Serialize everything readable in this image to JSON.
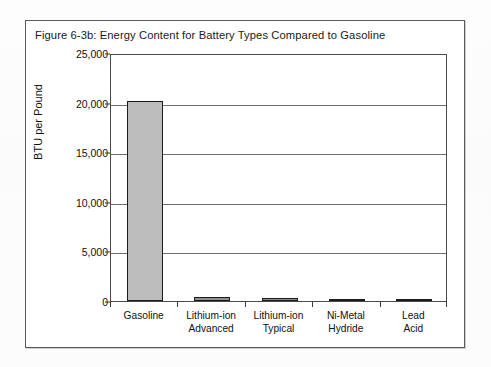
{
  "figure": {
    "title": "Figure 6-3b:  Energy Content for Battery Types Compared to Gasoline",
    "border_color": "#5a5a5a",
    "bar_fill_color": "#bdbdbd",
    "bar_border_color": "#1b1b1b",
    "gridline_color": "#6f6f6f"
  },
  "chart_data": {
    "type": "bar",
    "title": "Figure 6-3b:  Energy Content for Battery Types Compared to Gasoline",
    "xlabel": "",
    "ylabel": "BTU per Pound",
    "categories": [
      "Gasoline",
      "Lithium-ion Advanced",
      "Lithium-ion Typical",
      "Ni-Metal Hydride",
      "Lead Acid"
    ],
    "category_lines": [
      [
        "Gasoline"
      ],
      [
        "Lithium-ion",
        "Advanced"
      ],
      [
        "Lithium-ion",
        "Typical"
      ],
      [
        "Ni-Metal",
        "Hydride"
      ],
      [
        "Lead",
        "Acid"
      ]
    ],
    "values": [
      20200,
      450,
      300,
      200,
      100
    ],
    "ylim": [
      0,
      25000
    ],
    "ytick_values": [
      0,
      5000,
      10000,
      15000,
      20000,
      25000
    ],
    "ytick_labels": [
      "0",
      "5,000",
      "10,000",
      "15,000",
      "20,000",
      "25,000"
    ],
    "grid": "horizontal",
    "legend": "none"
  }
}
